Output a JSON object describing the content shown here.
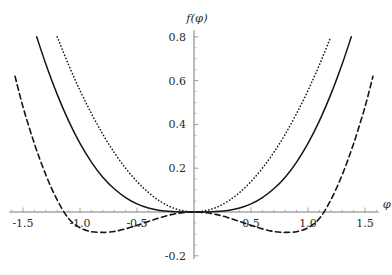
{
  "chart_data": {
    "type": "line",
    "title": "",
    "xlabel": "φ",
    "ylabel": "f(φ)",
    "xlim": [
      -1.62,
      1.62
    ],
    "ylim": [
      -0.215,
      0.83
    ],
    "grid": false,
    "legend": "none",
    "xticks": [
      -1.5,
      -1.0,
      -0.5,
      0.5,
      1.0,
      1.5
    ],
    "xticklabels": [
      "-1.5",
      "-1.0",
      "-0.5",
      "0.5",
      "1.0",
      "1.5"
    ],
    "yticks": [
      -0.2,
      0.2,
      0.4,
      0.6,
      0.8
    ],
    "yticklabels": [
      "-0.2",
      "0.2",
      "0.4",
      "0.6",
      "0.8"
    ],
    "x_minor_step": 0.1,
    "y_minor_step": 0.05,
    "axes_cross_at_origin": true,
    "series": [
      {
        "name": "dotted",
        "style": "dotted",
        "color": "#151515",
        "x": [
          -1.2,
          -1.1,
          -1.0,
          -0.9,
          -0.8,
          -0.7,
          -0.6,
          -0.5,
          -0.4,
          -0.3,
          -0.2,
          -0.1,
          0.0,
          0.1,
          0.2,
          0.3,
          0.4,
          0.5,
          0.6,
          0.7,
          0.8,
          0.9,
          1.0,
          1.1,
          1.2
        ],
        "values": [
          0.8,
          0.672,
          0.555,
          0.45,
          0.355,
          0.272,
          0.2,
          0.139,
          0.089,
          0.05,
          0.022,
          0.006,
          0.0,
          0.006,
          0.022,
          0.05,
          0.089,
          0.139,
          0.2,
          0.272,
          0.355,
          0.45,
          0.555,
          0.672,
          0.8
        ]
      },
      {
        "name": "solid",
        "style": "solid",
        "color": "#151515",
        "x": [
          -1.38,
          -1.3,
          -1.2,
          -1.1,
          -1.0,
          -0.9,
          -0.8,
          -0.7,
          -0.6,
          -0.5,
          -0.4,
          -0.3,
          -0.2,
          -0.1,
          0.0,
          0.1,
          0.2,
          0.3,
          0.4,
          0.5,
          0.6,
          0.7,
          0.8,
          0.9,
          1.0,
          1.1,
          1.2,
          1.3,
          1.38
        ],
        "values": [
          0.8,
          0.676,
          0.537,
          0.416,
          0.313,
          0.228,
          0.159,
          0.106,
          0.066,
          0.037,
          0.018,
          0.007,
          0.002,
          0.0,
          0.0,
          0.0,
          0.002,
          0.007,
          0.018,
          0.037,
          0.066,
          0.106,
          0.159,
          0.228,
          0.313,
          0.416,
          0.537,
          0.676,
          0.8
        ]
      },
      {
        "name": "dashed",
        "style": "dashed",
        "color": "#151515",
        "x": [
          -1.57,
          -1.5,
          -1.4,
          -1.3,
          -1.2,
          -1.1,
          -1.0,
          -0.9,
          -0.8,
          -0.78,
          -0.7,
          -0.6,
          -0.5,
          -0.4,
          -0.3,
          -0.2,
          -0.1,
          0.0,
          0.1,
          0.2,
          0.3,
          0.4,
          0.5,
          0.6,
          0.7,
          0.78,
          0.8,
          0.9,
          1.0,
          1.1,
          1.2,
          1.3,
          1.4,
          1.5,
          1.57
        ],
        "values": [
          0.62,
          0.48,
          0.312,
          0.17,
          0.055,
          -0.03,
          -0.072,
          -0.09,
          -0.093,
          -0.093,
          -0.089,
          -0.077,
          -0.061,
          -0.043,
          -0.026,
          -0.012,
          -0.003,
          0.0,
          -0.003,
          -0.012,
          -0.026,
          -0.043,
          -0.061,
          -0.077,
          -0.089,
          -0.093,
          -0.093,
          -0.09,
          -0.072,
          -0.03,
          0.055,
          0.17,
          0.312,
          0.48,
          0.62
        ]
      }
    ],
    "annotations": {
      "dashed_minima_x": [
        -0.78,
        0.78
      ],
      "dashed_minima_y": -0.093
    }
  }
}
